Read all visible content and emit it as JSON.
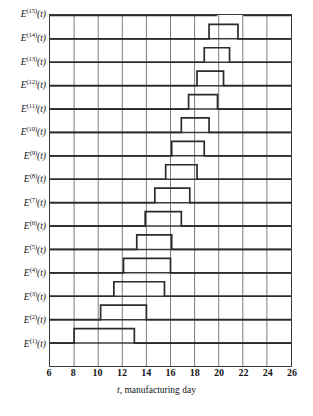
{
  "chart_data": {
    "type": "line",
    "title": "",
    "subtitle": "",
    "xlabel": "t, manufacturing day",
    "ylabel": "",
    "xlim": [
      6,
      26
    ],
    "ylim": [
      0,
      15
    ],
    "grid": true,
    "legend_position": "none",
    "xticks": [
      6,
      8,
      10,
      12,
      14,
      16,
      18,
      20,
      22,
      24,
      26
    ],
    "xtick_labels": [
      "6",
      "8",
      "10",
      "12",
      "14",
      "16",
      "18",
      "20",
      "22",
      "24",
      "26"
    ],
    "ytick_labels": [
      "E^(1)(t)",
      "E^(2)(t)",
      "E^(3)(t)",
      "E^(4)(t)",
      "E^(5)(t)",
      "E^(6)(t)",
      "E^(7)(t)",
      "E^(8)(t)",
      "E^(9)(t)",
      "E^(10)(t)",
      "E^(11)(t)",
      "E^(12)(t)",
      "E^(13)(t)",
      "E^(14)(t)",
      "E^(15)(t)"
    ],
    "note": "Each trace is a unit rectangular pulse on its own baseline; pulses shift progressively later with increasing index.",
    "series": [
      {
        "name": "E^(1)(t)",
        "baseline": 1,
        "pulse_start": 8.0,
        "pulse_end": 13.0,
        "pulse_height": 1
      },
      {
        "name": "E^(2)(t)",
        "baseline": 2,
        "pulse_start": 10.2,
        "pulse_end": 14.0,
        "pulse_height": 1
      },
      {
        "name": "E^(3)(t)",
        "baseline": 3,
        "pulse_start": 11.3,
        "pulse_end": 15.5,
        "pulse_height": 1
      },
      {
        "name": "E^(4)(t)",
        "baseline": 4,
        "pulse_start": 12.1,
        "pulse_end": 16.0,
        "pulse_height": 1
      },
      {
        "name": "E^(5)(t)",
        "baseline": 5,
        "pulse_start": 13.2,
        "pulse_end": 16.1,
        "pulse_height": 1
      },
      {
        "name": "E^(6)(t)",
        "baseline": 6,
        "pulse_start": 13.9,
        "pulse_end": 16.9,
        "pulse_height": 1
      },
      {
        "name": "E^(7)(t)",
        "baseline": 7,
        "pulse_start": 14.7,
        "pulse_end": 17.6,
        "pulse_height": 1
      },
      {
        "name": "E^(8)(t)",
        "baseline": 8,
        "pulse_start": 15.6,
        "pulse_end": 18.2,
        "pulse_height": 1
      },
      {
        "name": "E^(9)(t)",
        "baseline": 9,
        "pulse_start": 16.1,
        "pulse_end": 18.8,
        "pulse_height": 1
      },
      {
        "name": "E^(10)(t)",
        "baseline": 10,
        "pulse_start": 16.9,
        "pulse_end": 19.2,
        "pulse_height": 1
      },
      {
        "name": "E^(11)(t)",
        "baseline": 11,
        "pulse_start": 17.5,
        "pulse_end": 19.9,
        "pulse_height": 1
      },
      {
        "name": "E^(12)(t)",
        "baseline": 12,
        "pulse_start": 18.2,
        "pulse_end": 20.4,
        "pulse_height": 1
      },
      {
        "name": "E^(13)(t)",
        "baseline": 13,
        "pulse_start": 18.8,
        "pulse_end": 20.9,
        "pulse_height": 1
      },
      {
        "name": "E^(14)(t)",
        "baseline": 14,
        "pulse_start": 19.2,
        "pulse_end": 21.6,
        "pulse_height": 1
      },
      {
        "name": "E^(15)(t)",
        "baseline": 15,
        "pulse_start": 19.8,
        "pulse_end": 22.1,
        "pulse_height": 1
      }
    ]
  },
  "axis": {
    "x_title_variable": "t",
    "x_title_rest": ", manufacturing day"
  },
  "style": {
    "trace_color": "#2b2b2b",
    "grid_minor_color": "#7d7d7d",
    "grid_major_color": "#3a3a3a",
    "background": "#ffffff"
  },
  "caption_fragment": ""
}
